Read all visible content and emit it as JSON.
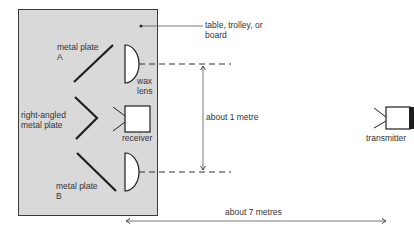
{
  "labels": {
    "table_note_line1": "table, trolley, or",
    "table_note_line2": "board",
    "plate_a_line1": "metal plate",
    "plate_a_line2": "A",
    "wax_line1": "wax",
    "wax_line2": "lens",
    "right_angled_line1": "right-angled",
    "right_angled_line2": "metal plate",
    "receiver": "receiver",
    "plate_b_line1": "metal plate",
    "plate_b_line2": "B",
    "about_1_metre": "about 1 metre",
    "about_7_metres": "about 7 metres",
    "transmitter": "transmitter"
  },
  "colors": {
    "board_fill": "#d9d9d9",
    "line": "#2a2a2a",
    "background": "#ffffff"
  }
}
